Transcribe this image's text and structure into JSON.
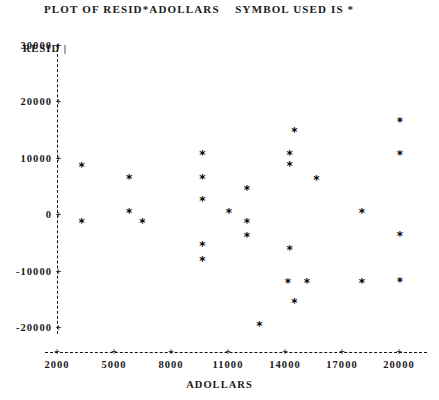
{
  "plot": {
    "title": "PLOT OF RESID*ADOLLARS    SYMBOL USED IS *",
    "symbol": "*",
    "y_axis_name": "RESID",
    "x_axis_name": "ADOLLARS",
    "tick_glyph": "+",
    "axis_color": "#111111",
    "point_color": "#000000",
    "y_ticks": [
      {
        "label": "30000",
        "value": 30000
      },
      {
        "label": "20000",
        "value": 20000
      },
      {
        "label": "10000",
        "value": 10000
      },
      {
        "label": "0",
        "value": 0
      },
      {
        "label": "-10000",
        "value": -10000
      },
      {
        "label": "-20000",
        "value": -20000
      }
    ],
    "x_ticks": [
      {
        "label": "2000",
        "value": 2000
      },
      {
        "label": "5000",
        "value": 5000
      },
      {
        "label": "8000",
        "value": 8000
      },
      {
        "label": "11000",
        "value": 11000
      },
      {
        "label": "14000",
        "value": 14000
      },
      {
        "label": "17000",
        "value": 17000
      },
      {
        "label": "20000",
        "value": 20000
      }
    ]
  },
  "chart_data": {
    "type": "scatter",
    "title": "PLOT OF RESID*ADOLLARS    SYMBOL USED IS *",
    "xlabel": "ADOLLARS",
    "ylabel": "RESID",
    "xlim": [
      2000,
      20000
    ],
    "ylim": [
      -20000,
      30000
    ],
    "grid": false,
    "legend": null,
    "marker": "*",
    "series": [
      {
        "name": "RESID",
        "points": [
          {
            "x": 3300,
            "y": 8100
          },
          {
            "x": 3300,
            "y": -1800
          },
          {
            "x": 5800,
            "y": 6000
          },
          {
            "x": 5800,
            "y": -100
          },
          {
            "x": 6500,
            "y": -1900
          },
          {
            "x": 9650,
            "y": 10100
          },
          {
            "x": 9650,
            "y": 6000
          },
          {
            "x": 9650,
            "y": 2000
          },
          {
            "x": 9650,
            "y": -6000
          },
          {
            "x": 9650,
            "y": -8500
          },
          {
            "x": 12000,
            "y": 3900
          },
          {
            "x": 11050,
            "y": -100
          },
          {
            "x": 12000,
            "y": -1800
          },
          {
            "x": 12000,
            "y": -4400
          },
          {
            "x": 12650,
            "y": -20000
          },
          {
            "x": 14250,
            "y": -6700
          },
          {
            "x": 14150,
            "y": -12400
          },
          {
            "x": 14500,
            "y": 14200
          },
          {
            "x": 14250,
            "y": 10100
          },
          {
            "x": 14250,
            "y": 8200
          },
          {
            "x": 14500,
            "y": -16100
          },
          {
            "x": 15150,
            "y": -12400
          },
          {
            "x": 15650,
            "y": 5700
          },
          {
            "x": 18050,
            "y": -100
          },
          {
            "x": 18050,
            "y": -12400
          },
          {
            "x": 20050,
            "y": 16100
          },
          {
            "x": 20050,
            "y": 10100
          },
          {
            "x": 20050,
            "y": -4100
          },
          {
            "x": 20050,
            "y": -12300
          }
        ]
      }
    ]
  }
}
